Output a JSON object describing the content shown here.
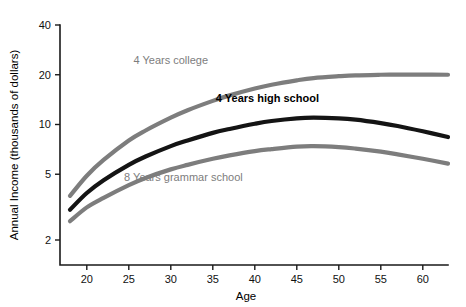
{
  "chart_data": {
    "type": "line",
    "title": "",
    "xlabel": "Age",
    "ylabel": "Annual Income (thousands of dollars)",
    "xlim": [
      18,
      63
    ],
    "ylim": [
      1.75,
      45
    ],
    "yscale": "log",
    "xscale": "linear",
    "grid": false,
    "legend": "inline-labels",
    "xticks": [
      20,
      25,
      30,
      35,
      40,
      45,
      50,
      55,
      60
    ],
    "xtick_labels": [
      "20",
      "25",
      "30",
      "35",
      "40",
      "45",
      "50",
      "55",
      "60"
    ],
    "yticks": [
      2,
      5,
      10,
      20,
      40
    ],
    "ytick_labels": [
      "2",
      "5",
      "10",
      "20",
      "40"
    ],
    "x": [
      18,
      20,
      22,
      25,
      27,
      30,
      32,
      35,
      37,
      40,
      42,
      45,
      47,
      50,
      52,
      55,
      57,
      60,
      63
    ],
    "series": [
      {
        "name": "4 Years college",
        "color": "#7d7d7d",
        "width": 4.2,
        "label_x": 30,
        "label_y": 23.2,
        "values": [
          3.7,
          4.9,
          6.1,
          8.0,
          9.2,
          11.0,
          12.2,
          13.9,
          15.0,
          16.5,
          17.4,
          18.5,
          19.1,
          19.6,
          19.85,
          20.0,
          20.05,
          20.05,
          20.0
        ]
      },
      {
        "name": "4 Years high school",
        "color": "#141414",
        "width": 4.2,
        "label_x": 41.5,
        "label_y": 13.6,
        "values": [
          3.05,
          3.85,
          4.6,
          5.7,
          6.4,
          7.4,
          8.0,
          8.9,
          9.4,
          10.1,
          10.5,
          10.9,
          11.0,
          10.9,
          10.7,
          10.2,
          9.8,
          9.1,
          8.4
        ]
      },
      {
        "name": "8 Years grammar school",
        "color": "#7d7d7d",
        "width": 4.2,
        "label_x": 31.5,
        "label_y": 4.55,
        "values": [
          2.6,
          3.15,
          3.6,
          4.3,
          4.75,
          5.35,
          5.7,
          6.2,
          6.5,
          6.9,
          7.1,
          7.35,
          7.4,
          7.3,
          7.15,
          6.85,
          6.6,
          6.2,
          5.8
        ]
      }
    ]
  },
  "axis_titles": {
    "x": "Age",
    "y": "Annual Income (thousands of dollars)"
  }
}
